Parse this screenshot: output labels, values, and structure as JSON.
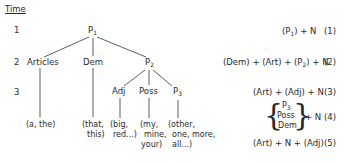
{
  "time_label": "Time",
  "times": [
    "1",
    "2",
    "3"
  ],
  "tree": {
    "root": {
      "label": "P",
      "sub": "1"
    },
    "level2": [
      {
        "label": "Articles"
      },
      {
        "label": "Dem"
      },
      {
        "label": "P",
        "sub": "2"
      }
    ],
    "level3": [
      {
        "label": "Adj"
      },
      {
        "label": "Poss"
      },
      {
        "label": "P",
        "sub": "3"
      }
    ],
    "leaves": {
      "articles": "(a, the)",
      "dem_1": "(that,",
      "dem_2": "this)",
      "adj_1": "(big,",
      "adj_2": "red...)",
      "poss_1": "(my,",
      "poss_2": "mine,",
      "poss_3": "your)",
      "p3_1": "(other,",
      "p3_2": "one, more,",
      "p3_3": "all...)"
    }
  },
  "rules": [
    {
      "pre": "(P",
      "sub": "1",
      "post": ") + N",
      "num": "(1)"
    },
    {
      "pre": "(Dem) + (Art) + (P",
      "sub": "2",
      "post": ") + N",
      "num": "(2)"
    },
    {
      "text": "(Art) + (Adj) + N",
      "num": "(3)"
    },
    {
      "brace_items": [
        "P",
        "Poss",
        "Dem"
      ],
      "brace_sub": "3",
      "post": "+ N",
      "num": "(4)"
    },
    {
      "text": "(Art) + N + (Adj)",
      "num": "(5)"
    }
  ]
}
